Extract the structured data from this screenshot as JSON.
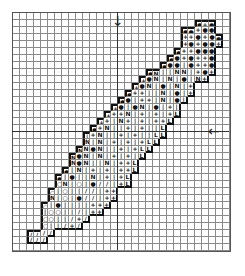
{
  "pattern": {
    "title": "Feather cross-stitch chart",
    "columns": 31,
    "rows": 34,
    "cell_px": 7,
    "center_col": 15,
    "center_row": 17,
    "arrows": {
      "top": "↓",
      "right": "←"
    },
    "symbols": {
      "D": "●",
      "O": "○",
      "P": "+",
      "I": "|",
      "N": "N",
      "L": "L",
      "S": "/"
    },
    "rows_data": [
      "...............................",
      "..........................DPD..",
      "........................DDPDD..",
      "........................PPDPDD.",
      "........................PDPDDP.",
      ".......................DPPDDD..",
      "......................DDPDPPD..",
      ".....................DDDIDPPD..",
      "...................DNIINNIPDP..",
      "..................PDNINIDINP...",
      ".................PDNIDINIP.....",
      "................DPPIINIDIP.....",
      "...............DDIPPINIDI......",
      "..............PDIDNIDIPI.......",
      ".............PPPNIPIPIPL.......",
      "............PPINPIPIPPL........",
      "...........DPNIIPIPIIL.........",
      "..........IPNIIPIPIILL.........",
      "..........NINIPIPIPLL..........",
      ".........NNDNIIPIPLL...........",
      "........NDNINIPIPIL............",
      "........NDNIINIPPL.............",
      ".......DINIPIPIPPL.............",
      "......DIDIINIPIPL..............",
      "......ONIOIDSSIPL..............",
      ".....OIOIISSIPP................",
      ".....NIOIDSSIPP................",
      "....OIDIIIIPPP.................",
      "....IOOIISIPP..................",
      "....OOIISPS....................",
      "....OIISPS.....................",
      "..SSSS.........................",
      "..SSS..........................",
      "..............................."
    ]
  }
}
